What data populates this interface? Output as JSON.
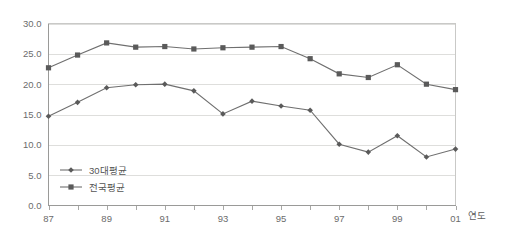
{
  "chart_data": {
    "type": "line",
    "title": "",
    "xlabel": "연도",
    "ylabel": "",
    "x": [
      1987,
      1988,
      1989,
      1990,
      1991,
      1992,
      1993,
      1994,
      1995,
      1996,
      1997,
      1998,
      1999,
      2000,
      2001
    ],
    "categories": [
      "87",
      "88",
      "89",
      "90",
      "91",
      "92",
      "93",
      "94",
      "95",
      "96",
      "97",
      "98",
      "99",
      "00",
      "01"
    ],
    "xtick_labels": [
      "87",
      "89",
      "91",
      "93",
      "95",
      "97",
      "99",
      "01"
    ],
    "xtick_values": [
      1987,
      1989,
      1991,
      1993,
      1995,
      1997,
      1999,
      2001
    ],
    "ytick_labels": [
      "0.0",
      "5.0",
      "10.0",
      "15.0",
      "20.0",
      "25.0",
      "30.0"
    ],
    "ytick_values": [
      0,
      5,
      10,
      15,
      20,
      25,
      30
    ],
    "ylim": [
      0,
      30
    ],
    "xlim": [
      1987,
      2001
    ],
    "grid": true,
    "legend_position": "inside-lower-left",
    "series": [
      {
        "name": "30대평균",
        "marker": "diamond",
        "color": "#5a5a5a",
        "values": [
          14.7,
          17.0,
          19.4,
          19.9,
          20.0,
          18.9,
          15.1,
          17.2,
          16.4,
          15.7,
          10.1,
          8.8,
          11.5,
          8.0,
          9.3
        ]
      },
      {
        "name": "전국평균",
        "marker": "square",
        "color": "#5a5a5a",
        "values": [
          22.7,
          24.8,
          26.8,
          26.1,
          26.2,
          25.8,
          26.0,
          26.1,
          26.2,
          24.2,
          21.7,
          21.1,
          23.2,
          20.0,
          19.1
        ]
      }
    ]
  },
  "axis": {
    "x_axis_title": "연도"
  },
  "legend": {
    "items": [
      {
        "label": "30대평균"
      },
      {
        "label": "전국평균"
      }
    ]
  }
}
